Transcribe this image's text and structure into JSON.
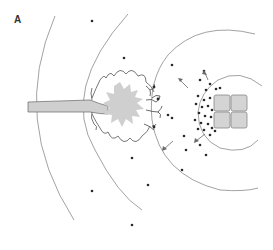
{
  "figure": {
    "panel_label": "A",
    "colors": {
      "background": "#ffffff",
      "arc": "#8a8a8a",
      "dot": "#2a2a2a",
      "burst_fill": "#cfcfcf",
      "cell_fill": "#d4d4d4",
      "label": "#333333"
    }
  },
  "diagram": {
    "elements": [
      {
        "id": "neuron-axon",
        "kind": "process",
        "label": ""
      },
      {
        "id": "neuron-soma-burst",
        "kind": "spike-burst",
        "label": ""
      },
      {
        "id": "synaptic-terminals",
        "kind": "terminal",
        "count": 4
      },
      {
        "id": "target-cells",
        "kind": "cell-grid",
        "rows": 2,
        "cols": 2
      },
      {
        "id": "diffusion-arcs",
        "kind": "concentric-arcs",
        "count": 5
      },
      {
        "id": "released-molecules",
        "kind": "dots"
      },
      {
        "id": "diffusion-arrows",
        "kind": "arrows",
        "count": 3
      }
    ]
  }
}
